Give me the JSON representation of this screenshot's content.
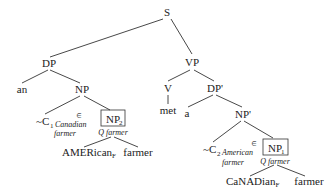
{
  "tree": {
    "root": "S",
    "subject": {
      "label": "DP",
      "det": "an",
      "np": {
        "label": "NP",
        "alt": {
          "tilde": "~",
          "c_label": "C",
          "c_index": "1",
          "gloss_line1": "Canadian",
          "gloss_line2": "farmer",
          "elem_symbol": "∈"
        },
        "focus_np": {
          "label": "NP",
          "index": "2",
          "annotation": "Q farmer",
          "children": {
            "adj_base": "AMERican",
            "adj_focus_sub": "F",
            "noun": "farmer"
          }
        }
      }
    },
    "predicate": {
      "label": "VP",
      "verb_label": "V",
      "verb": "met",
      "object": {
        "label": "DP'",
        "det": "a",
        "np": {
          "label": "NP'",
          "alt": {
            "tilde": "~",
            "c_label": "C",
            "c_index": "2",
            "gloss_line1": "American",
            "gloss_line2": "farmer",
            "elem_symbol": "∈"
          },
          "focus_np": {
            "label": "NP",
            "index": "1",
            "annotation": "Q farmer",
            "children": {
              "adj_base": "CaNADian",
              "adj_focus_sub": "F",
              "noun": "farmer"
            }
          }
        }
      }
    }
  },
  "colors": {
    "text": "#222222",
    "lines": "#333333",
    "background": "#ffffff"
  }
}
